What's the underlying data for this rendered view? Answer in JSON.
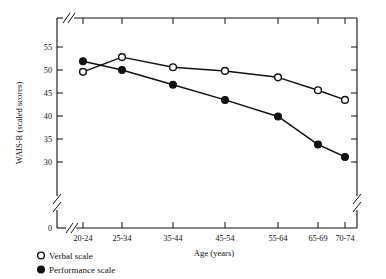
{
  "chart_data": {
    "type": "line",
    "title": "",
    "xlabel": "Age (years)",
    "ylabel": "WAIS-R (scaled scores)",
    "categories": [
      "20-24",
      "25-34",
      "35-44",
      "45-54",
      "55-64",
      "65-69",
      "70-74"
    ],
    "ylim": [
      28,
      57
    ],
    "yticks": [
      0,
      30,
      35,
      40,
      45,
      50,
      55
    ],
    "ytick_labels": [
      "0",
      "30",
      "35",
      "40",
      "45",
      "50",
      "55"
    ],
    "grid": false,
    "axis_break_y": true,
    "axis_break_x": true,
    "legend_position": "below-left",
    "series": [
      {
        "name": "Verbal scale",
        "marker": "open-circle",
        "values": [
          49.6,
          52.8,
          50.6,
          49.8,
          48.4,
          45.6,
          43.5
        ]
      },
      {
        "name": "Performance scale",
        "marker": "filled-circle",
        "values": [
          51.9,
          50.0,
          46.8,
          43.5,
          39.9,
          33.8,
          31.1
        ]
      }
    ]
  },
  "axes": {
    "y_title": "WAIS-R (scaled scores)",
    "x_title": "Age (years)",
    "y_tick_labels": [
      "55",
      "50",
      "45",
      "40",
      "35",
      "30",
      "0"
    ],
    "x_tick_labels": [
      "20-24",
      "25-34",
      "35-44",
      "45-54",
      "55-64",
      "65-69",
      "70-74"
    ]
  },
  "legend": {
    "items": [
      {
        "label": "Verbal scale",
        "marker": "open-circle"
      },
      {
        "label": "Performance scale",
        "marker": "filled-circle"
      }
    ]
  }
}
